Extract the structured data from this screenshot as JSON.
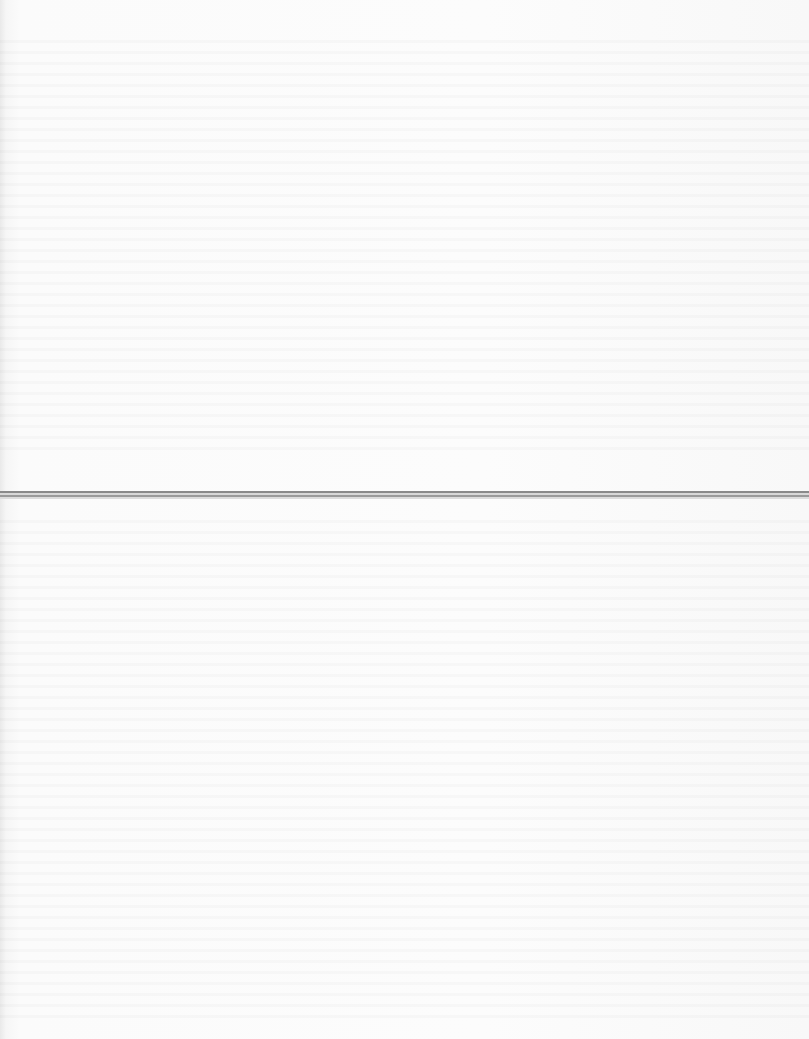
{
  "document": {
    "description": "Blank scanned page with faint illegible bleed-through and a horizontal fold line",
    "text_content": "",
    "colors": {
      "paper": "#fcfcfc",
      "fold_line_dark": "#8a8a8a",
      "fold_line_light": "#d8d8d8"
    }
  }
}
